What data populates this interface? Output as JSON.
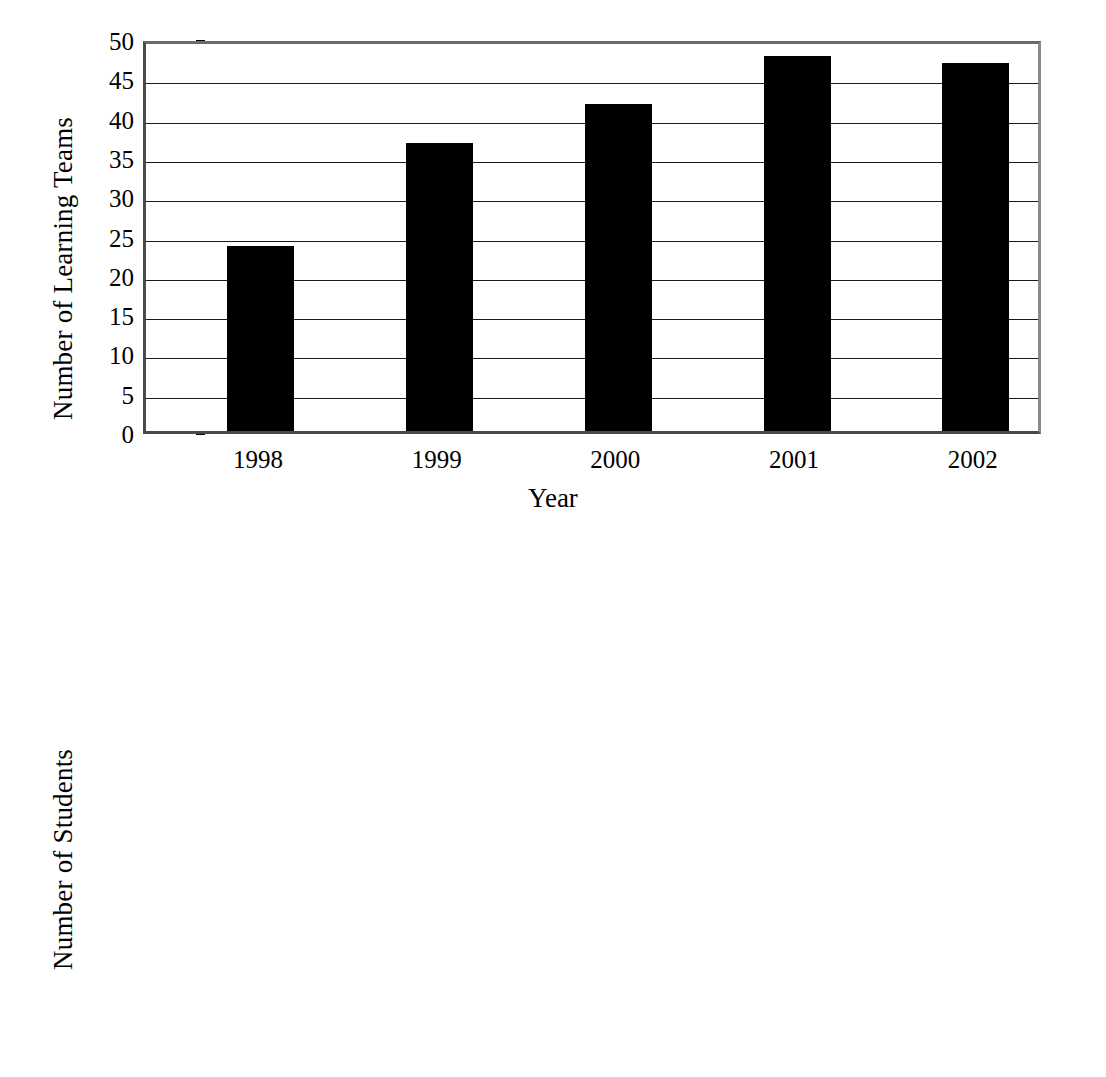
{
  "chart_data": [
    {
      "type": "bar",
      "title": "",
      "xlabel": "Year",
      "ylabel": "Number of Learning Teams",
      "categories": [
        "1998",
        "1999",
        "2000",
        "2001",
        "2002"
      ],
      "values": [
        23.5,
        36.6,
        41.6,
        47.7,
        46.8
      ],
      "ylim": [
        0,
        50
      ],
      "yticks": [
        0,
        5,
        10,
        15,
        20,
        25,
        30,
        35,
        40,
        45,
        50
      ],
      "ytick_labels": [
        "0",
        "5",
        "10",
        "15",
        "20",
        "25",
        "30",
        "35",
        "40",
        "45",
        "50"
      ],
      "grid": true,
      "legend": false,
      "bar_color": "#000000"
    },
    {
      "type": "bar",
      "title": "",
      "xlabel": "Year",
      "ylabel": "Number of Students",
      "categories": [
        "1998",
        "1999",
        "2000",
        "2001",
        "2002"
      ],
      "values": [
        1130,
        1755,
        1860,
        2140,
        2180
      ],
      "ylim": [
        0,
        2500
      ],
      "yticks": [
        0,
        500,
        1000,
        1500,
        2000,
        2500
      ],
      "ytick_labels": [
        "0",
        "500",
        "1000",
        "1500",
        "2000",
        "2500"
      ],
      "grid": true,
      "legend": false,
      "bar_color": "#000000"
    }
  ]
}
